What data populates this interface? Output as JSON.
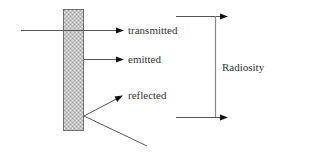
{
  "diagram": {
    "colors": {
      "background": "#ffffff",
      "line": "#555555",
      "arrowhead": "#111111",
      "wall_fill": "#c4c4c4",
      "wall_border": "#6e6e6e",
      "text": "#333333"
    },
    "wall": {
      "label": "surface",
      "x": 63,
      "y": 9,
      "width": 20,
      "height": 121
    },
    "rays": [
      {
        "id": "transmitted",
        "label": "transmitted",
        "from": [
          21,
          30
        ],
        "to": [
          123,
          30
        ]
      },
      {
        "id": "emitted",
        "label": "emitted",
        "from": [
          83,
          59
        ],
        "to": [
          123,
          59
        ]
      },
      {
        "id": "reflected",
        "label": "reflected",
        "from": [
          84,
          116
        ],
        "to": [
          122,
          96
        ]
      },
      {
        "id": "incident",
        "label": "",
        "from": [
          147,
          146
        ],
        "to": [
          84,
          116
        ]
      }
    ],
    "labels": {
      "transmitted": "transmitted",
      "emitted": "emitted",
      "reflected": "reflected",
      "radiosity": "Radiosity"
    },
    "bracket": {
      "label": "Radiosity",
      "vertical_x": 215,
      "top_y": 16,
      "bottom_y": 117,
      "top_arrow": {
        "from": [
          176,
          16
        ],
        "to": [
          227,
          16
        ]
      },
      "bottom_arrow": {
        "from": [
          176,
          117
        ],
        "to": [
          227,
          117
        ]
      }
    }
  }
}
